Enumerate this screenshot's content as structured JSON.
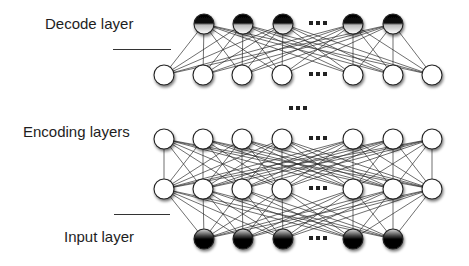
{
  "labels": {
    "decode": "Decode layer",
    "encoding": "Encoding layers",
    "input": "Input layer"
  },
  "colors": {
    "edge": "#2a2a2a",
    "node_stroke": "#222222",
    "node_fill": "#ffffff",
    "dark": "#000000",
    "text": "#1e1e1e"
  },
  "layout": {
    "columns_full": [
      164,
      203,
      242,
      282,
      353,
      393,
      432
    ],
    "columns_short": [
      204,
      243,
      283,
      353,
      393
    ],
    "ellipsis_x": 318,
    "node_radius": 10
  },
  "layers": [
    {
      "name": "decode-layer",
      "y": 24,
      "type": "short",
      "style": "dark-top"
    },
    {
      "name": "hidden-top-layer",
      "y": 75,
      "type": "full",
      "style": "plain"
    },
    {
      "name": "encoding-layer-1",
      "y": 139,
      "type": "full",
      "style": "plain"
    },
    {
      "name": "encoding-layer-2",
      "y": 189,
      "type": "full",
      "style": "plain"
    },
    {
      "name": "input-layer",
      "y": 239,
      "type": "short",
      "style": "dark-bottom"
    }
  ],
  "connections": [
    [
      0,
      1
    ],
    [
      2,
      3
    ],
    [
      3,
      4
    ]
  ],
  "middle_ellipsis": {
    "x": 298,
    "y": 108
  },
  "separators": [
    {
      "name": "decode-separator",
      "x1": 113,
      "x2": 171,
      "y": 49
    },
    {
      "name": "input-separator",
      "x1": 114,
      "x2": 170,
      "y": 214
    }
  ]
}
